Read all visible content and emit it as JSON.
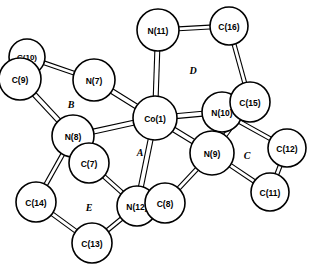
{
  "figure": {
    "kind": "molecular-structure-diagram",
    "style": "ball-and-stick ORTEP-like line drawing",
    "background_color": "#ffffff",
    "line_color": "#000000",
    "fill_color": "#ffffff"
  },
  "atoms": [
    {
      "id": "N11",
      "label": "N(11)",
      "x": 158,
      "y": 30,
      "r": 21,
      "font": 8.5,
      "z": 10
    },
    {
      "id": "C16",
      "label": "C(16)",
      "x": 229,
      "y": 26,
      "r": 19,
      "font": 8.5,
      "z": 10
    },
    {
      "id": "C10",
      "label": "C(10)",
      "x": 27,
      "y": 57,
      "r": 18,
      "font": 8.0,
      "z": 10
    },
    {
      "id": "C9",
      "label": "C(9)",
      "x": 20,
      "y": 79,
      "r": 21,
      "font": 8.5,
      "z": 11
    },
    {
      "id": "N7",
      "label": "N(7)",
      "x": 94,
      "y": 80,
      "r": 21,
      "font": 8.5,
      "z": 10
    },
    {
      "id": "C15",
      "label": "C(15)",
      "x": 250,
      "y": 102,
      "r": 20,
      "font": 8.5,
      "z": 12
    },
    {
      "id": "N10",
      "label": "N(10)",
      "x": 222,
      "y": 112,
      "r": 20,
      "font": 8.5,
      "z": 11
    },
    {
      "id": "Co1",
      "label": "Co(1)",
      "x": 155,
      "y": 118,
      "r": 22,
      "font": 8.5,
      "z": 13
    },
    {
      "id": "N8",
      "label": "N(8)",
      "x": 73,
      "y": 136,
      "r": 21,
      "font": 8.5,
      "z": 10
    },
    {
      "id": "C12",
      "label": "C(12)",
      "x": 287,
      "y": 148,
      "r": 19,
      "font": 8.5,
      "z": 10
    },
    {
      "id": "N9",
      "label": "N(9)",
      "x": 212,
      "y": 153,
      "r": 22,
      "font": 8.5,
      "z": 12
    },
    {
      "id": "C7",
      "label": "C(7)",
      "x": 89,
      "y": 163,
      "r": 20,
      "font": 8.5,
      "z": 12
    },
    {
      "id": "C11",
      "label": "C(11)",
      "x": 270,
      "y": 192,
      "r": 19,
      "font": 8.5,
      "z": 10
    },
    {
      "id": "C14",
      "label": "C(14)",
      "x": 36,
      "y": 202,
      "r": 20,
      "font": 8.5,
      "z": 10
    },
    {
      "id": "C8",
      "label": "C(8)",
      "x": 165,
      "y": 203,
      "r": 20,
      "font": 8.5,
      "z": 12
    },
    {
      "id": "N12",
      "label": "N(12)",
      "x": 137,
      "y": 206,
      "r": 20,
      "font": 8.5,
      "z": 11
    },
    {
      "id": "C13",
      "label": "C(13)",
      "x": 92,
      "y": 243,
      "r": 20,
      "font": 8.5,
      "z": 10
    }
  ],
  "bonds": [
    {
      "from": "N11",
      "to": "C16",
      "w": 5
    },
    {
      "from": "N11",
      "to": "Co1",
      "w": 6
    },
    {
      "from": "C16",
      "to": "C15",
      "w": 5
    },
    {
      "from": "C10",
      "to": "C9",
      "w": 5
    },
    {
      "from": "C10",
      "to": "N7",
      "w": 5
    },
    {
      "from": "C9",
      "to": "N8",
      "w": 6
    },
    {
      "from": "N7",
      "to": "Co1",
      "w": 6
    },
    {
      "from": "C15",
      "to": "N10",
      "w": 5
    },
    {
      "from": "C15",
      "to": "N9",
      "w": 5
    },
    {
      "from": "N10",
      "to": "Co1",
      "w": 6
    },
    {
      "from": "N10",
      "to": "C12",
      "w": 5
    },
    {
      "from": "Co1",
      "to": "N8",
      "w": 6
    },
    {
      "from": "Co1",
      "to": "N9",
      "w": 6
    },
    {
      "from": "Co1",
      "to": "N12",
      "w": 6
    },
    {
      "from": "N8",
      "to": "C7",
      "w": 5
    },
    {
      "from": "N8",
      "to": "C14",
      "w": 5
    },
    {
      "from": "C12",
      "to": "C11",
      "w": 5
    },
    {
      "from": "N9",
      "to": "C11",
      "w": 5
    },
    {
      "from": "N9",
      "to": "C8",
      "w": 5
    },
    {
      "from": "C7",
      "to": "N12",
      "w": 5
    },
    {
      "from": "C14",
      "to": "C13",
      "w": 5
    },
    {
      "from": "C8",
      "to": "N12",
      "w": 5
    },
    {
      "from": "C13",
      "to": "N12",
      "w": 5
    }
  ],
  "ring_labels": [
    {
      "id": "ringA",
      "text": "A",
      "x": 140,
      "y": 152,
      "font": 10
    },
    {
      "id": "ringB",
      "text": "B",
      "x": 71,
      "y": 104,
      "font": 10
    },
    {
      "id": "ringC",
      "text": "C",
      "x": 247,
      "y": 155,
      "font": 10
    },
    {
      "id": "ringD",
      "text": "D",
      "x": 193,
      "y": 70,
      "font": 10
    },
    {
      "id": "ringE",
      "text": "E",
      "x": 89,
      "y": 207,
      "font": 10
    }
  ]
}
